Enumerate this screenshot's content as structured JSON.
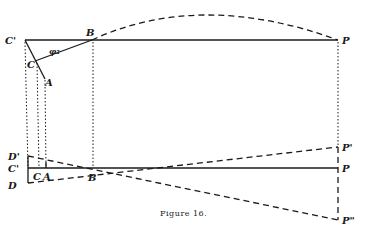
{
  "figure": {
    "caption": "Figure 16.",
    "upper": {
      "labels": {
        "C_prime": "C'",
        "B": "B",
        "P": "P",
        "C": "C",
        "A": "A",
        "phi": "φ₂"
      }
    },
    "lower": {
      "labels": {
        "D_prime": "D'",
        "C_prime": "C'",
        "D": "D",
        "C": "C",
        "A": "A",
        "B": "B",
        "P": "P",
        "P_prime": "P'",
        "P_double": "P\""
      }
    },
    "colors": {
      "ink": "#1a1a1a",
      "background": "#ffffff"
    }
  }
}
